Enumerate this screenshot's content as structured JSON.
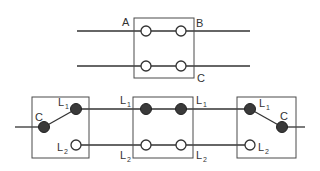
{
  "diagram": {
    "title": "",
    "colors": {
      "line": "#333333",
      "box": "#4a4a4a",
      "filled_terminal": "#3a3a3a",
      "background": "#ffffff"
    },
    "top_switch": {
      "labels": {
        "a": "A",
        "b": "B",
        "c": "C"
      },
      "terminals": [
        "open",
        "open",
        "open",
        "open"
      ]
    },
    "bottom_circuit": {
      "left_switch": {
        "common": {
          "letter": "C"
        },
        "l1": {
          "letter": "L",
          "sub": "1"
        },
        "l2": {
          "letter": "L",
          "sub": "2"
        }
      },
      "middle_switch": {
        "l1_left": {
          "letter": "L",
          "sub": "1"
        },
        "l1_right": {
          "letter": "L",
          "sub": "1"
        },
        "l2_left": {
          "letter": "L",
          "sub": "2"
        },
        "l2_right": {
          "letter": "L",
          "sub": "2"
        }
      },
      "right_switch": {
        "common": {
          "letter": "C"
        },
        "l1": {
          "letter": "L",
          "sub": "1"
        },
        "l2": {
          "letter": "L",
          "sub": "2"
        }
      }
    }
  }
}
